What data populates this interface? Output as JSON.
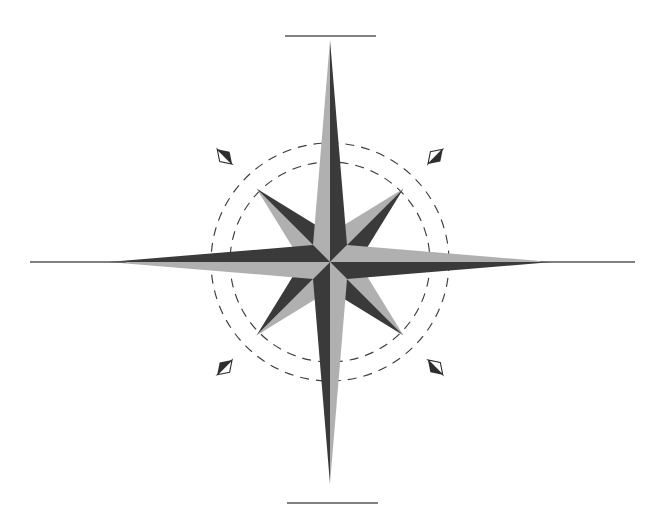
{
  "figure": {
    "canvas": {
      "width": 661,
      "height": 531,
      "background": "#ffffff"
    }
  },
  "palette": {
    "background": "#ffffff",
    "light_gray": "#b0b0b0",
    "dark_gray": "#3a3a3a",
    "outline": "#2e2e2e",
    "rule_line": "#55595c",
    "dash_circle": "#3d3d3d"
  },
  "geometry": {
    "center_x": 330,
    "center_y": 262,
    "cardinal_tip_length": 222,
    "cardinal_half_width": 17,
    "ordinal_tip_length": 104,
    "ordinal_half_width": 20,
    "dash_circle_outer_radius": 119,
    "dash_circle_inner_radius": 100,
    "ornament_distance": 149,
    "ornament_length": 21,
    "ornament_half_width": 7
  },
  "points": [
    {
      "name": "north",
      "label": "N",
      "angle_deg": 0,
      "kind": "cardinal",
      "left_fill": "light_gray",
      "right_fill": "dark_gray"
    },
    {
      "name": "east",
      "label": "E",
      "angle_deg": 90,
      "kind": "cardinal",
      "left_fill": "light_gray",
      "right_fill": "dark_gray"
    },
    {
      "name": "south",
      "label": "S",
      "angle_deg": 180,
      "kind": "cardinal",
      "left_fill": "light_gray",
      "right_fill": "dark_gray"
    },
    {
      "name": "west",
      "label": "W",
      "angle_deg": 270,
      "kind": "cardinal",
      "left_fill": "light_gray",
      "right_fill": "dark_gray"
    },
    {
      "name": "northeast",
      "label": "NE",
      "angle_deg": 45,
      "kind": "ordinal",
      "left_fill": "light_gray",
      "right_fill": "dark_gray"
    },
    {
      "name": "southeast",
      "label": "SE",
      "angle_deg": 135,
      "kind": "ordinal",
      "left_fill": "light_gray",
      "right_fill": "dark_gray"
    },
    {
      "name": "southwest",
      "label": "SW",
      "angle_deg": 225,
      "kind": "ordinal",
      "left_fill": "light_gray",
      "right_fill": "dark_gray"
    },
    {
      "name": "northwest",
      "label": "NW",
      "angle_deg": 315,
      "kind": "ordinal",
      "left_fill": "light_gray",
      "right_fill": "dark_gray"
    }
  ],
  "ornaments": [
    {
      "name": "ornament-northwest",
      "angle_deg": 315
    },
    {
      "name": "ornament-northeast",
      "angle_deg": 45
    },
    {
      "name": "ornament-southeast",
      "angle_deg": 135
    },
    {
      "name": "ornament-southwest",
      "angle_deg": 225
    }
  ],
  "dashed_circles": [
    {
      "name": "bearing-circle-outer",
      "radius": 119,
      "dash": "9 7"
    },
    {
      "name": "bearing-circle-inner",
      "radius": 100,
      "dash": "9 7"
    }
  ],
  "rule_lines": [
    {
      "name": "rule-line-top",
      "x1": 285,
      "y1": 36,
      "x2": 376,
      "y2": 36
    },
    {
      "name": "rule-line-left",
      "x1": 30,
      "y1": 262,
      "x2": 126,
      "y2": 262
    },
    {
      "name": "rule-line-right",
      "x1": 540,
      "y1": 262,
      "x2": 635,
      "y2": 262
    },
    {
      "name": "rule-line-bottom",
      "x1": 287,
      "y1": 503,
      "x2": 378,
      "y2": 503
    }
  ]
}
